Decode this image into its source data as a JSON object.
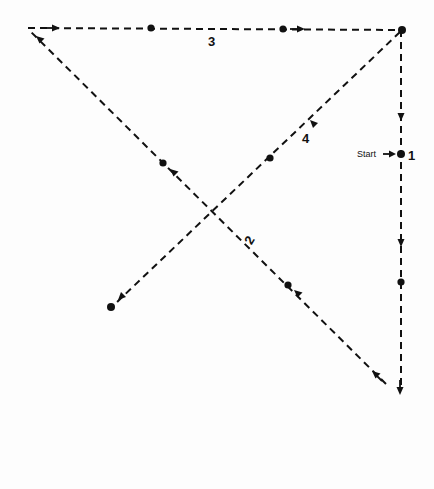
{
  "diagram": {
    "type": "movement-path",
    "start_label": "Start",
    "segments": [
      {
        "label": "1",
        "from": [
          401,
          30
        ],
        "to": [
          401,
          393
        ],
        "note": "down the right side from top-right to bottom-right (start at marked dot)"
      },
      {
        "label": "2",
        "from": [
          388,
          385
        ],
        "to": [
          28,
          28
        ],
        "note": "diagonal from bottom-right to top-left"
      },
      {
        "label": "3",
        "from": [
          28,
          28
        ],
        "to": [
          401,
          30
        ],
        "note": "across the top from top-left to top-right"
      },
      {
        "label": "4",
        "from": [
          401,
          30
        ],
        "to": [
          111,
          307
        ],
        "note": "diagonal from top-right to bottom-left"
      }
    ],
    "dots": [
      [
        151,
        28
      ],
      [
        283,
        29
      ],
      [
        402,
        30
      ],
      [
        401,
        154
      ],
      [
        401,
        282
      ],
      [
        288,
        285
      ],
      [
        163,
        163
      ],
      [
        270,
        158
      ],
      [
        111,
        307
      ]
    ],
    "colors": {
      "line": "#111111",
      "background": "#fdfdfd"
    }
  }
}
